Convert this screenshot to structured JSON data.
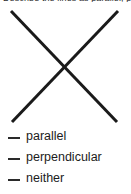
{
  "page": {
    "background_color": "#ffffff",
    "ink_color": "#1a1a1a"
  },
  "prompt": {
    "clipped_text": "Describe the lines as parallel, perpendicular, or neither.",
    "visible": "partially clipped at top edge"
  },
  "figure": {
    "name": "two-intersecting-lines",
    "stroke_color": "#1a1a1a",
    "stroke_width": 3,
    "lines": [
      {
        "id": "line-a",
        "orientation": "top-left-to-bottom-right",
        "x1": 11,
        "y1": 5,
        "x2": 117,
        "y2": 116
      },
      {
        "id": "line-b",
        "orientation": "bottom-left-to-top-right",
        "x1": 12,
        "y1": 116,
        "x2": 118,
        "y2": 5
      }
    ],
    "intersection": {
      "x": 66,
      "y": 64
    }
  },
  "choices": {
    "blank_glyph": "__",
    "items": [
      {
        "id": "choice-parallel",
        "label": "parallel",
        "selected": false
      },
      {
        "id": "choice-perpendicular",
        "label": "perpendicular",
        "selected": false
      },
      {
        "id": "choice-neither",
        "label": "neither",
        "selected": false
      }
    ]
  }
}
